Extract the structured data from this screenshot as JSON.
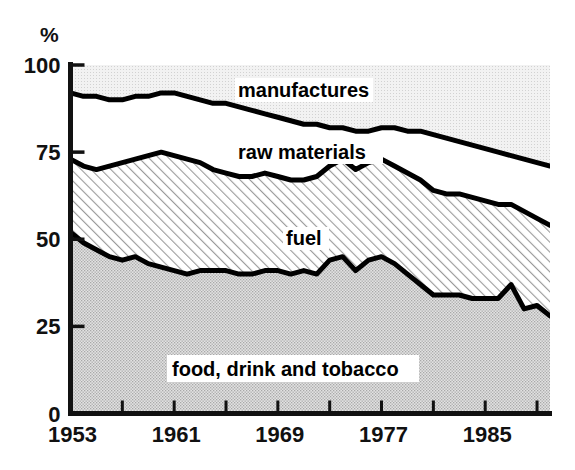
{
  "chart_data": {
    "type": "area",
    "title": "",
    "subtitle": "",
    "xlabel": "",
    "ylabel": "%",
    "ylim": [
      0,
      100
    ],
    "xlim": [
      1953,
      1990
    ],
    "grid": false,
    "legend_position": "inline-annotations",
    "stacked": true,
    "y_ticks": [
      "0",
      "25",
      "50",
      "75",
      "100"
    ],
    "y_tick_values": [
      0,
      25,
      50,
      75,
      100
    ],
    "x_ticks": [
      "1953",
      "1961",
      "1969",
      "1977",
      "1985"
    ],
    "x_tick_values": [
      1953,
      1961,
      1969,
      1977,
      1985
    ],
    "x_minor_tick_interval": 4,
    "x": [
      1953,
      1954,
      1955,
      1956,
      1957,
      1958,
      1959,
      1960,
      1961,
      1962,
      1963,
      1964,
      1965,
      1966,
      1967,
      1968,
      1969,
      1970,
      1971,
      1972,
      1973,
      1974,
      1975,
      1976,
      1977,
      1978,
      1979,
      1980,
      1981,
      1982,
      1983,
      1984,
      1985,
      1986,
      1987,
      1988,
      1989,
      1990
    ],
    "series": [
      {
        "name": "food, drink and tobacco",
        "fill": "stipple-gray",
        "color": "#d9d9d9",
        "cumulative_top": [
          52,
          49,
          47,
          45,
          44,
          45,
          43,
          42,
          41,
          40,
          41,
          41,
          41,
          40,
          40,
          41,
          41,
          40,
          41,
          40,
          44,
          45,
          41,
          44,
          45,
          43,
          40,
          37,
          34,
          34,
          34,
          33,
          33,
          33,
          37,
          30,
          31,
          28
        ],
        "values": [
          52,
          49,
          47,
          45,
          44,
          45,
          43,
          42,
          41,
          40,
          41,
          41,
          41,
          40,
          40,
          41,
          41,
          40,
          41,
          40,
          44,
          45,
          41,
          44,
          45,
          43,
          40,
          37,
          34,
          34,
          34,
          33,
          33,
          33,
          37,
          30,
          31,
          28
        ]
      },
      {
        "name": "fuel",
        "fill": "diagonal-hatch",
        "color": "#ffffff",
        "cumulative_top": [
          53,
          51,
          50,
          49,
          48,
          50,
          49,
          48,
          47,
          46,
          47,
          47,
          47,
          46,
          46,
          47,
          47,
          45,
          46,
          46,
          50,
          52,
          48,
          50,
          51,
          49,
          46,
          44,
          41,
          41,
          41,
          40,
          41,
          41,
          44,
          38,
          39,
          35
        ],
        "values": [
          1,
          2,
          3,
          4,
          4,
          5,
          6,
          6,
          6,
          6,
          6,
          6,
          6,
          6,
          6,
          6,
          6,
          5,
          5,
          6,
          6,
          7,
          7,
          6,
          6,
          6,
          6,
          7,
          7,
          7,
          7,
          7,
          8,
          8,
          7,
          8,
          8,
          7
        ]
      },
      {
        "name": "raw materials",
        "fill": "white",
        "color": "#ffffff",
        "cumulative_top": [
          73,
          71,
          70,
          71,
          72,
          73,
          74,
          75,
          74,
          73,
          72,
          70,
          69,
          68,
          68,
          69,
          68,
          67,
          67,
          68,
          71,
          73,
          70,
          72,
          73,
          71,
          69,
          67,
          64,
          63,
          63,
          62,
          61,
          60,
          60,
          58,
          56,
          54
        ],
        "values": [
          20,
          20,
          20,
          22,
          24,
          23,
          25,
          27,
          27,
          27,
          25,
          23,
          22,
          22,
          22,
          22,
          21,
          22,
          21,
          22,
          21,
          21,
          22,
          22,
          22,
          22,
          23,
          23,
          23,
          22,
          22,
          22,
          20,
          19,
          16,
          20,
          17,
          19
        ]
      },
      {
        "name": "manufactures",
        "fill": "light-gray",
        "color": "#ececec",
        "cumulative_top": [
          92,
          91,
          91,
          90,
          90,
          91,
          91,
          92,
          92,
          91,
          90,
          89,
          89,
          88,
          87,
          86,
          85,
          84,
          83,
          83,
          82,
          82,
          81,
          81,
          82,
          82,
          81,
          81,
          80,
          79,
          78,
          77,
          76,
          75,
          74,
          73,
          72,
          71
        ],
        "values": [
          8,
          9,
          9,
          10,
          10,
          9,
          9,
          8,
          8,
          9,
          10,
          11,
          11,
          12,
          13,
          14,
          15,
          16,
          17,
          17,
          18,
          18,
          19,
          19,
          18,
          18,
          19,
          19,
          20,
          21,
          22,
          23,
          24,
          25,
          26,
          27,
          28,
          29
        ]
      }
    ],
    "boundary_lines": {
      "top_manufactures_lower_bound": [
        92,
        91,
        91,
        90,
        90,
        91,
        91,
        92,
        92,
        91,
        90,
        89,
        89,
        88,
        87,
        86,
        85,
        84,
        83,
        83,
        82,
        82,
        81,
        81,
        82,
        82,
        81,
        81,
        80,
        79,
        78,
        77,
        76,
        75,
        74,
        73,
        72,
        71
      ],
      "raw_materials_lower_bound": [
        73,
        71,
        70,
        71,
        72,
        73,
        74,
        75,
        74,
        73,
        72,
        70,
        69,
        68,
        68,
        69,
        68,
        67,
        67,
        68,
        71,
        73,
        70,
        72,
        73,
        71,
        69,
        67,
        64,
        63,
        63,
        62,
        61,
        60,
        60,
        58,
        56,
        54
      ],
      "fuel_lower_bound": [
        52,
        49,
        47,
        45,
        44,
        45,
        43,
        42,
        41,
        40,
        41,
        41,
        41,
        40,
        40,
        41,
        41,
        40,
        41,
        40,
        44,
        45,
        41,
        44,
        45,
        43,
        40,
        37,
        34,
        34,
        34,
        33,
        33,
        33,
        37,
        30,
        31,
        28
      ]
    }
  },
  "annotations": {
    "manufactures": "manufactures",
    "raw_materials": "raw materials",
    "fuel": "fuel",
    "food_drink_tobacco": "food, drink and tobacco"
  },
  "axis": {
    "y_unit": "%",
    "y_ticks": [
      "100",
      "75",
      "50",
      "25",
      "0"
    ],
    "x_ticks": [
      "1953",
      "1961",
      "1969",
      "1977",
      "1985"
    ]
  },
  "colors": {
    "axis": "#111111",
    "line": "#000000",
    "manufactures_fill": "#ececec",
    "raw_materials_fill": "#ffffff",
    "fuel_fill": "#ffffff",
    "food_fill": "#d9d9d9",
    "background": "#ffffff"
  }
}
